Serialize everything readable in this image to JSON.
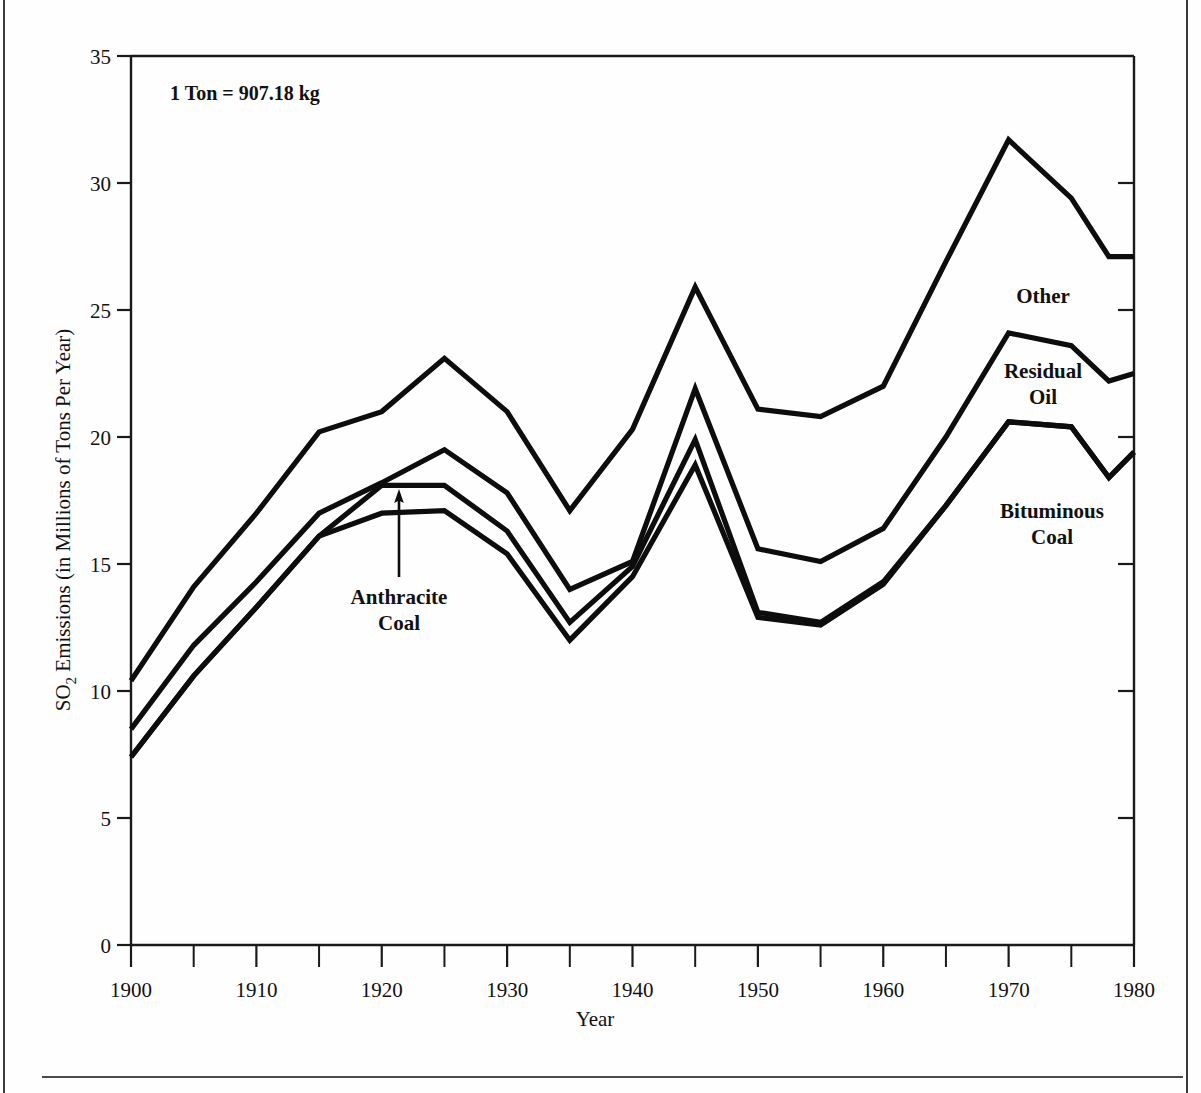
{
  "figure": {
    "note": "1 Ton  =  907.18 kg",
    "xlabel": "Year",
    "ylabel_parts": {
      "pre": "SO",
      "sub": "2",
      "post": " Emissions (in Millions of Tons Per Year)"
    },
    "ylabel": "SO2 Emissions (in Millions of Tons Per Year)",
    "line_color": "#0d0d0d",
    "axis_color": "#1a1a1a",
    "background": "#fefefe"
  },
  "labels": {
    "other": "Other",
    "residual_oil_line1": "Residual",
    "residual_oil_line2": "Oil",
    "bituminous_line1": "Bituminous",
    "bituminous_line2": "Coal",
    "anthracite_line1": "Anthracite",
    "anthracite_line2": "Coal"
  },
  "chart_data": {
    "type": "line",
    "title": "",
    "subtitle": "",
    "annotation": "1 Ton  =  907.18 kg",
    "xlabel": "Year",
    "ylabel": "SO2 Emissions (in Millions of Tons Per Year)",
    "xlim": [
      1900,
      1980
    ],
    "ylim": [
      0,
      35
    ],
    "xticks": [
      1900,
      1910,
      1920,
      1930,
      1940,
      1950,
      1960,
      1970,
      1980
    ],
    "xticks_minor": [
      1905,
      1915,
      1925,
      1935,
      1945,
      1955,
      1965,
      1975
    ],
    "yticks": [
      0,
      5,
      10,
      15,
      20,
      25,
      30,
      35
    ],
    "grid": false,
    "legend_position": "inline-annotations",
    "stacked": true,
    "cumulative_note": "Lines are cumulative totals; bands between lines are the named source contributions.",
    "x": [
      1900,
      1905,
      1910,
      1915,
      1920,
      1925,
      1930,
      1935,
      1940,
      1945,
      1950,
      1955,
      1960,
      1965,
      1970,
      1975,
      1978,
      1980
    ],
    "series": [
      {
        "name": "Total (with Other)",
        "band_label": "Other",
        "values": [
          10.4,
          14.1,
          17.0,
          20.2,
          21.0,
          23.1,
          21.0,
          17.1,
          20.3,
          25.9,
          21.1,
          20.8,
          22.0,
          26.9,
          31.7,
          29.4,
          27.1,
          27.1
        ]
      },
      {
        "name": "Bituminous Coal + Anthracite + Residual Oil",
        "band_label": "Residual Oil",
        "values": [
          8.5,
          11.8,
          14.3,
          17.0,
          18.2,
          19.5,
          17.8,
          14.0,
          15.1,
          21.9,
          15.6,
          15.1,
          16.4,
          20.0,
          24.1,
          23.6,
          22.2,
          22.5
        ]
      },
      {
        "name": "Bituminous Coal + Anthracite",
        "band_label": "Anthracite Coal",
        "values": [
          7.4,
          10.6,
          13.3,
          16.1,
          18.1,
          18.1,
          16.3,
          12.7,
          14.9,
          19.9,
          13.1,
          12.7,
          14.3,
          17.3,
          20.6,
          20.4,
          18.4,
          19.4
        ]
      },
      {
        "name": "Bituminous Coal",
        "band_label": "Bituminous Coal",
        "values": [
          7.4,
          10.6,
          13.3,
          16.1,
          17.0,
          17.1,
          15.4,
          12.0,
          14.5,
          18.9,
          12.9,
          12.6,
          14.2,
          17.3,
          20.6,
          20.4,
          18.4,
          19.4
        ]
      }
    ]
  }
}
